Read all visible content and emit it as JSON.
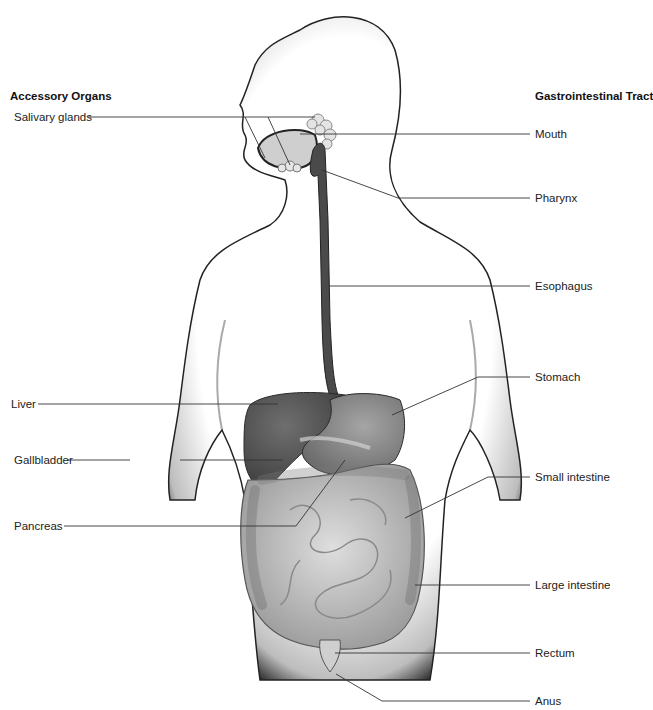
{
  "diagram": {
    "left_heading": "Accessory Organs",
    "right_heading": "Gastrointestinal Tract",
    "accessory_organs": [
      {
        "label": "Salivary glands"
      },
      {
        "label": "Liver"
      },
      {
        "label": "Gallbladder"
      },
      {
        "label": "Pancreas"
      }
    ],
    "gastrointestinal_tract": [
      {
        "label": "Mouth"
      },
      {
        "label": "Pharynx"
      },
      {
        "label": "Esophagus"
      },
      {
        "label": "Stomach"
      },
      {
        "label": "Small intestine"
      },
      {
        "label": "Large intestine"
      },
      {
        "label": "Rectum"
      },
      {
        "label": "Anus"
      }
    ],
    "colors": {
      "line": "#333333",
      "liver": "#5a5a5a",
      "stomach": "#8a8a8a",
      "intestine": "#c4c4c4",
      "body_outline": "#222222"
    }
  }
}
